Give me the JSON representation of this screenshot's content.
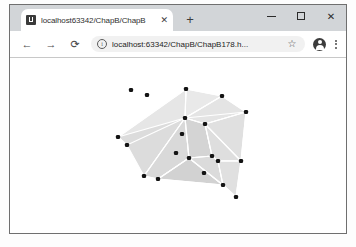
{
  "browser": {
    "tab": {
      "title": "localhost63342/ChapB/ChapB",
      "favicon_name": "page-favicon",
      "close_label": "✕"
    },
    "newtab_label": "+",
    "window_controls": {
      "minimize_label": "–",
      "maximize_label": "□",
      "close_label": "✕"
    },
    "toolbar": {
      "back_label": "←",
      "forward_label": "→",
      "reload_label": "⟳",
      "info_label": "i",
      "url": "localhost:63342/ChapB/ChapB178.h...",
      "url_placeholder": "Search Google or type a URL",
      "bookmark_label": "☆",
      "menu_label": "⋮"
    }
  },
  "chart_data": {
    "type": "scatter",
    "title": "",
    "xlabel": "",
    "ylabel": "",
    "grid": false,
    "legend": "none",
    "colors": {
      "face_light": "#ededed",
      "face_mid": "#e2e2e2",
      "face_dark": "#d6d6d6",
      "face_darker": "#cfcfcf",
      "edge": "#ffffff",
      "point": "#141414",
      "background": "#ffffff"
    },
    "viewbox": {
      "width": 336,
      "height": 176
    },
    "points": [
      {
        "id": 0,
        "x": 176,
        "y": 31,
        "hull": true
      },
      {
        "id": 1,
        "x": 212,
        "y": 38,
        "hull": true
      },
      {
        "id": 2,
        "x": 236,
        "y": 54,
        "hull": true
      },
      {
        "id": 3,
        "x": 121,
        "y": 32,
        "hull": false
      },
      {
        "id": 4,
        "x": 137,
        "y": 37,
        "hull": false
      },
      {
        "id": 5,
        "x": 175,
        "y": 60,
        "hull": false
      },
      {
        "id": 6,
        "x": 195,
        "y": 66,
        "hull": false
      },
      {
        "id": 7,
        "x": 172,
        "y": 76,
        "hull": false
      },
      {
        "id": 8,
        "x": 108,
        "y": 79,
        "hull": true
      },
      {
        "id": 9,
        "x": 117,
        "y": 87,
        "hull": false
      },
      {
        "id": 10,
        "x": 166,
        "y": 95,
        "hull": false
      },
      {
        "id": 11,
        "x": 179,
        "y": 100,
        "hull": false
      },
      {
        "id": 12,
        "x": 202,
        "y": 98,
        "hull": false
      },
      {
        "id": 13,
        "x": 208,
        "y": 103,
        "hull": false
      },
      {
        "id": 14,
        "x": 231,
        "y": 103,
        "hull": true
      },
      {
        "id": 15,
        "x": 194,
        "y": 115,
        "hull": false
      },
      {
        "id": 16,
        "x": 134,
        "y": 118,
        "hull": true
      },
      {
        "id": 17,
        "x": 148,
        "y": 121,
        "hull": true
      },
      {
        "id": 18,
        "x": 213,
        "y": 127,
        "hull": true
      },
      {
        "id": 19,
        "x": 226,
        "y": 139,
        "hull": true
      }
    ],
    "faces": [
      {
        "id": "f1",
        "shade": "#e9e9e9",
        "vertices": [
          [
            176,
            31
          ],
          [
            212,
            38
          ],
          [
            175,
            60
          ]
        ]
      },
      {
        "id": "f2",
        "shade": "#e4e4e4",
        "vertices": [
          [
            212,
            38
          ],
          [
            236,
            54
          ],
          [
            195,
            66
          ],
          [
            175,
            60
          ]
        ]
      },
      {
        "id": "f3",
        "shade": "#e0e0e0",
        "vertices": [
          [
            236,
            54
          ],
          [
            231,
            103
          ],
          [
            208,
            103
          ],
          [
            195,
            66
          ]
        ]
      },
      {
        "id": "f4",
        "shade": "#e6e6e6",
        "vertices": [
          [
            176,
            31
          ],
          [
            175,
            60
          ],
          [
            117,
            87
          ],
          [
            108,
            79
          ]
        ]
      },
      {
        "id": "f5",
        "shade": "#dcdcdc",
        "vertices": [
          [
            108,
            79
          ],
          [
            117,
            87
          ],
          [
            134,
            118
          ],
          [
            175,
            60
          ]
        ]
      },
      {
        "id": "f6",
        "shade": "#d9d9d9",
        "vertices": [
          [
            175,
            60
          ],
          [
            134,
            118
          ],
          [
            148,
            121
          ],
          [
            179,
            100
          ]
        ]
      },
      {
        "id": "f7",
        "shade": "#d4d4d4",
        "vertices": [
          [
            175,
            60
          ],
          [
            179,
            100
          ],
          [
            202,
            98
          ],
          [
            195,
            66
          ]
        ]
      },
      {
        "id": "f8",
        "shade": "#dedede",
        "vertices": [
          [
            195,
            66
          ],
          [
            202,
            98
          ],
          [
            208,
            103
          ],
          [
            231,
            103
          ]
        ]
      },
      {
        "id": "f9",
        "shade": "#d2d2d2",
        "vertices": [
          [
            148,
            121
          ],
          [
            179,
            100
          ],
          [
            213,
            127
          ]
        ]
      },
      {
        "id": "f10",
        "shade": "#dbdbdb",
        "vertices": [
          [
            179,
            100
          ],
          [
            202,
            98
          ],
          [
            208,
            103
          ],
          [
            213,
            127
          ]
        ]
      },
      {
        "id": "f11",
        "shade": "#e0e0e0",
        "vertices": [
          [
            208,
            103
          ],
          [
            231,
            103
          ],
          [
            226,
            139
          ],
          [
            213,
            127
          ]
        ]
      }
    ],
    "edges": [
      [
        [
          176,
          31
        ],
        [
          212,
          38
        ]
      ],
      [
        [
          212,
          38
        ],
        [
          236,
          54
        ]
      ],
      [
        [
          236,
          54
        ],
        [
          231,
          103
        ]
      ],
      [
        [
          231,
          103
        ],
        [
          226,
          139
        ]
      ],
      [
        [
          226,
          139
        ],
        [
          213,
          127
        ]
      ],
      [
        [
          213,
          127
        ],
        [
          148,
          121
        ]
      ],
      [
        [
          148,
          121
        ],
        [
          134,
          118
        ]
      ],
      [
        [
          134,
          118
        ],
        [
          108,
          79
        ]
      ],
      [
        [
          108,
          79
        ],
        [
          176,
          31
        ]
      ],
      [
        [
          176,
          31
        ],
        [
          175,
          60
        ]
      ],
      [
        [
          175,
          60
        ],
        [
          212,
          38
        ]
      ],
      [
        [
          175,
          60
        ],
        [
          236,
          54
        ]
      ],
      [
        [
          175,
          60
        ],
        [
          195,
          66
        ]
      ],
      [
        [
          195,
          66
        ],
        [
          236,
          54
        ]
      ],
      [
        [
          195,
          66
        ],
        [
          231,
          103
        ]
      ],
      [
        [
          175,
          60
        ],
        [
          117,
          87
        ]
      ],
      [
        [
          117,
          87
        ],
        [
          108,
          79
        ]
      ],
      [
        [
          175,
          60
        ],
        [
          134,
          118
        ]
      ],
      [
        [
          175,
          60
        ],
        [
          179,
          100
        ]
      ],
      [
        [
          179,
          100
        ],
        [
          148,
          121
        ]
      ],
      [
        [
          179,
          100
        ],
        [
          202,
          98
        ]
      ],
      [
        [
          202,
          98
        ],
        [
          195,
          66
        ]
      ],
      [
        [
          202,
          98
        ],
        [
          208,
          103
        ]
      ],
      [
        [
          208,
          103
        ],
        [
          231,
          103
        ]
      ],
      [
        [
          179,
          100
        ],
        [
          213,
          127
        ]
      ],
      [
        [
          208,
          103
        ],
        [
          213,
          127
        ]
      ]
    ]
  }
}
